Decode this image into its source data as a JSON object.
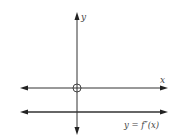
{
  "diagram": {
    "axes": {
      "x_label": "x",
      "y_label": "y"
    },
    "curve": {
      "label": "y = f″(x)",
      "description": "horizontal line below the x-axis (negative constant second derivative)"
    },
    "origin_marker": "open-circle",
    "colors": {
      "line": "#333333",
      "text": "#444444",
      "background": "#ffffff"
    }
  }
}
